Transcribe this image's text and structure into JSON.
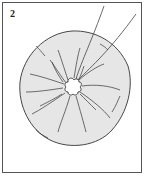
{
  "illustration": {
    "step_number": "2",
    "subject": "gathered fabric circle with threads pulled from center",
    "colors": {
      "fabric_fill": "#e6e6e6",
      "line": "#333333",
      "border": "#555555",
      "background": "#ffffff"
    }
  }
}
